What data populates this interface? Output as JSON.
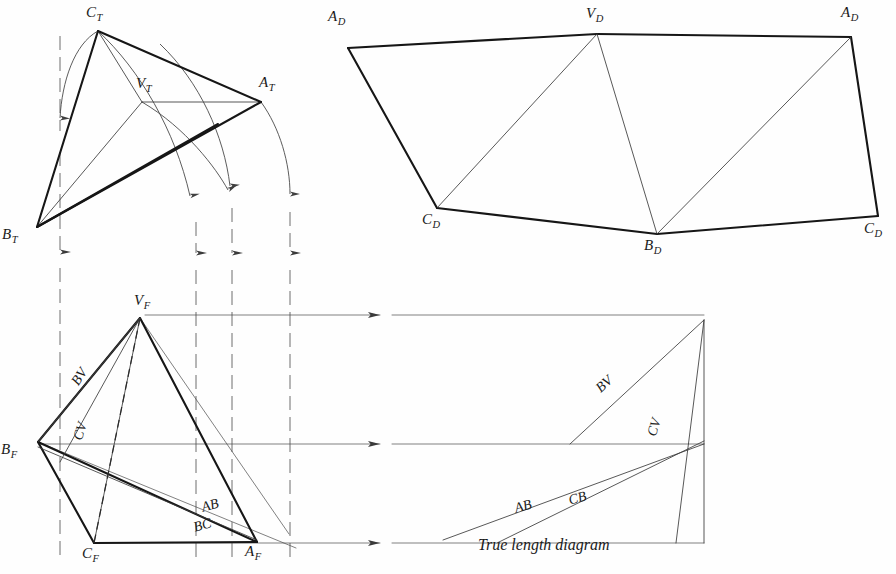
{
  "figure": {
    "caption": "True length diagram",
    "ink_color": "#1a1a1a",
    "paper_color": "#fefefe"
  },
  "views": {
    "top_view": {
      "name": "Top view",
      "labels": [
        {
          "id": "CT",
          "base": "C",
          "sub": "T",
          "x": 88,
          "y": 6,
          "vx": 98,
          "vy": 31
        },
        {
          "id": "VT",
          "base": "V",
          "sub": "T",
          "x": 139,
          "y": 77,
          "vx": 142,
          "vy": 102
        },
        {
          "id": "AT",
          "base": "A",
          "sub": "T",
          "x": 261,
          "y": 76,
          "vx": 261,
          "vy": 102
        },
        {
          "id": "BT",
          "base": "B",
          "sub": "T",
          "x": 4,
          "y": 228,
          "vx": 37,
          "vy": 227
        }
      ]
    },
    "development_view": {
      "name": "Development",
      "labels": [
        {
          "id": "AD-left",
          "base": "A",
          "sub": "D",
          "x": 330,
          "y": 10,
          "vx": 348,
          "vy": 48
        },
        {
          "id": "VD",
          "base": "V",
          "sub": "D",
          "x": 588,
          "y": 7,
          "vx": 597,
          "vy": 34
        },
        {
          "id": "AD-right",
          "base": "A",
          "sub": "D",
          "x": 843,
          "y": 6,
          "vx": 851,
          "vy": 37
        },
        {
          "id": "CD-left",
          "base": "C",
          "sub": "D",
          "x": 424,
          "y": 213,
          "vx": 437,
          "vy": 208
        },
        {
          "id": "BD",
          "base": "B",
          "sub": "D",
          "x": 646,
          "y": 239,
          "vx": 657,
          "vy": 234
        },
        {
          "id": "CD-right",
          "base": "C",
          "sub": "D",
          "x": 866,
          "y": 222,
          "vx": 878,
          "vy": 216
        }
      ]
    },
    "front_view": {
      "name": "Front view",
      "labels": [
        {
          "id": "VF",
          "base": "V",
          "sub": "F",
          "x": 136,
          "y": 294,
          "vx": 140,
          "vy": 318
        },
        {
          "id": "BF",
          "base": "B",
          "sub": "F",
          "x": 2,
          "y": 443,
          "vx": 38,
          "vy": 442
        },
        {
          "id": "CF",
          "base": "C",
          "sub": "F",
          "x": 84,
          "y": 547,
          "vx": 94,
          "vy": 543
        },
        {
          "id": "AF",
          "base": "A",
          "sub": "F",
          "x": 247,
          "y": 545,
          "vx": 257,
          "vy": 542
        }
      ],
      "edge_labels": [
        {
          "id": "BV",
          "text": "BV",
          "x": 75,
          "y": 378,
          "rot": -58
        },
        {
          "id": "CV",
          "text": "CV",
          "x": 80,
          "y": 430,
          "rot": -72
        },
        {
          "id": "AB",
          "text": "AB",
          "x": 203,
          "y": 500,
          "rot": -16
        },
        {
          "id": "BC",
          "text": "BC",
          "x": 196,
          "y": 518,
          "rot": -16
        }
      ]
    },
    "true_length_diagram": {
      "name": "True length diagram",
      "caption": "True length diagram",
      "caption_x": 478,
      "caption_y": 545,
      "edge_labels": [
        {
          "id": "BV",
          "text": "BV",
          "x": 600,
          "y": 380,
          "rot": -40
        },
        {
          "id": "CV",
          "text": "CV",
          "x": 655,
          "y": 424,
          "rot": -72
        },
        {
          "id": "AB",
          "text": "AB",
          "x": 518,
          "y": 498,
          "rot": -16
        },
        {
          "id": "CB",
          "text": "CB",
          "x": 570,
          "y": 491,
          "rot": -16
        }
      ]
    }
  },
  "geometry": {
    "top_view": {
      "vertices": {
        "CT": [
          98,
          31
        ],
        "VT": [
          142,
          102
        ],
        "AT": [
          261,
          102
        ],
        "BT": [
          37,
          227
        ]
      },
      "thick_edges": [
        [
          "CT",
          "AT"
        ],
        [
          "CT",
          "BT"
        ],
        [
          "BT",
          "AT"
        ]
      ],
      "thin_edges": [
        [
          "CT",
          "VT"
        ],
        [
          "VT",
          "AT"
        ],
        [
          "VT",
          "BT"
        ]
      ]
    },
    "development_view": {
      "vertices": {
        "AD_left": [
          348,
          48
        ],
        "VD": [
          597,
          34
        ],
        "AD_right": [
          851,
          37
        ],
        "CD_left": [
          437,
          208
        ],
        "BD": [
          657,
          234
        ],
        "CD_right": [
          878,
          216
        ]
      },
      "outline": [
        "AD_left",
        "VD",
        "AD_right",
        "CD_right",
        "BD",
        "CD_left"
      ],
      "fold_lines": [
        [
          "VD",
          "CD_left"
        ],
        [
          "VD",
          "BD"
        ],
        [
          "BD",
          "AD_right"
        ]
      ]
    },
    "front_view": {
      "vertices": {
        "VF": [
          140,
          318
        ],
        "BF": [
          38,
          442
        ],
        "CF": [
          94,
          543
        ],
        "AF": [
          257,
          542
        ]
      },
      "thick_edges": [
        [
          "BF",
          "VF"
        ],
        [
          "VF",
          "AF"
        ],
        [
          "BF",
          "CF"
        ],
        [
          "CF",
          "AF"
        ],
        [
          "BF",
          "AF"
        ]
      ],
      "thin_edges": [
        [
          "VF",
          "CF"
        ],
        [
          "BF",
          "AF"
        ]
      ],
      "hidden_edge": [
        "VF",
        "CF"
      ]
    },
    "true_length_diagram": {
      "apex_top": [
        704,
        320
      ],
      "apex_mid": [
        704,
        444
      ],
      "base_right": [
        704,
        543
      ],
      "base_left": [
        443,
        543
      ],
      "mid_left": [
        443,
        444
      ],
      "top_left": [
        443,
        320
      ],
      "rays": [
        {
          "name": "BV",
          "from": [
            570,
            444
          ],
          "to": [
            704,
            320
          ]
        },
        {
          "name": "CV",
          "from": [
            676,
            543
          ],
          "to": [
            704,
            320
          ]
        },
        {
          "name": "AB",
          "from": [
            443,
            540
          ],
          "to": [
            704,
            444
          ]
        },
        {
          "name": "CB",
          "from": [
            497,
            543
          ],
          "to": [
            704,
            444
          ]
        }
      ]
    },
    "projection_lines": {
      "horizontal": [
        {
          "y": 315,
          "x1": 145,
          "x2": 704,
          "arrow_x": 388
        },
        {
          "y": 444,
          "x1": 40,
          "x2": 704,
          "arrow_x": 388
        },
        {
          "y": 543,
          "x1": 95,
          "x2": 704,
          "arrow_x": 388
        }
      ],
      "vertical": [
        {
          "x": 60,
          "y1": 30,
          "y2": 560,
          "arrow_y": 263
        },
        {
          "x": 196,
          "y1": 102,
          "y2": 560,
          "arrow_y": 263
        },
        {
          "x": 232,
          "y1": 102,
          "y2": 560,
          "arrow_y": 263
        },
        {
          "x": 290,
          "y1": 102,
          "y2": 560,
          "arrow_y": 263
        }
      ]
    },
    "swing_arcs": [
      {
        "name": "arc-CT",
        "from": [
          98,
          31
        ],
        "to": [
          60,
          143
        ],
        "label": "C to vertical"
      },
      {
        "name": "arc-VT",
        "from": [
          142,
          102
        ],
        "to": [
          196,
          215
        ],
        "label": "V to vertical"
      },
      {
        "name": "arc-AT-1",
        "from": [
          210,
          76
        ],
        "to": [
          232,
          200
        ],
        "label": "mid to vertical"
      },
      {
        "name": "arc-AT-2",
        "from": [
          261,
          102
        ],
        "to": [
          290,
          205
        ],
        "label": "A to vertical"
      }
    ]
  }
}
